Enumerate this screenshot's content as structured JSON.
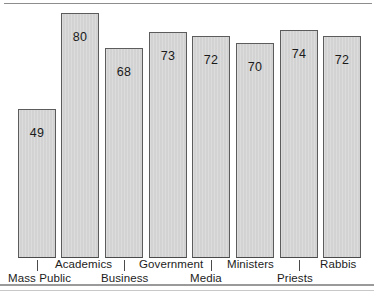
{
  "chart_data": {
    "type": "bar",
    "title": "",
    "subtitle": "",
    "xlabel": "",
    "ylabel": "",
    "grid": false,
    "legend": "none",
    "ylim": [
      0,
      88
    ],
    "categories": [
      "Mass Public",
      "Academics",
      "Business",
      "Government",
      "Media",
      "Ministers",
      "Priests",
      "Rabbis"
    ],
    "values": [
      49,
      80,
      68,
      73,
      72,
      70,
      74,
      72
    ],
    "value_labels": [
      "49",
      "80",
      "68",
      "73",
      "72",
      "70",
      "74",
      "72"
    ],
    "series": [
      {
        "name": "",
        "values": [
          49,
          80,
          68,
          73,
          72,
          70,
          74,
          72
        ]
      }
    ],
    "colors": {
      "bar_fill": "#d5d5d5",
      "bar_border": "#5c5c5c",
      "text": "#1c1c1c",
      "frame": "#8d8d8d",
      "background": "#ffffff"
    },
    "bars": [
      {
        "label": "Mass Public",
        "value": 49,
        "value_label": "49",
        "x": 18,
        "width": 38,
        "top": 109,
        "bottom": 258,
        "label_row": "lower",
        "label_x": 8,
        "tick": true
      },
      {
        "label": "Academics",
        "value": 80,
        "value_label": "80",
        "x": 61,
        "width": 38,
        "top": 13,
        "bottom": 258,
        "label_row": "upper",
        "label_x": 55,
        "tick": false
      },
      {
        "label": "Business",
        "value": 68,
        "value_label": "68",
        "x": 105,
        "width": 38,
        "top": 48,
        "bottom": 258,
        "label_row": "lower",
        "label_x": 101,
        "tick": true
      },
      {
        "label": "Government",
        "value": 73,
        "value_label": "73",
        "x": 149,
        "width": 38,
        "top": 32,
        "bottom": 258,
        "label_row": "upper",
        "label_x": 139,
        "tick": false
      },
      {
        "label": "Media",
        "value": 72,
        "value_label": "72",
        "x": 192,
        "width": 38,
        "top": 36,
        "bottom": 258,
        "label_row": "lower",
        "label_x": 190,
        "tick": true
      },
      {
        "label": "Ministers",
        "value": 70,
        "value_label": "70",
        "x": 236,
        "width": 38,
        "top": 43,
        "bottom": 258,
        "label_row": "upper",
        "label_x": 227,
        "tick": false
      },
      {
        "label": "Priests",
        "value": 74,
        "value_label": "74",
        "x": 280,
        "width": 38,
        "top": 30,
        "bottom": 258,
        "label_row": "lower",
        "label_x": 277,
        "tick": true
      },
      {
        "label": "Rabbis",
        "value": 72,
        "value_label": "72",
        "x": 323,
        "width": 38,
        "top": 36,
        "bottom": 258,
        "label_row": "upper",
        "label_x": 320,
        "tick": false
      }
    ],
    "label_rows": {
      "upper_y": 258,
      "lower_y": 272
    }
  }
}
